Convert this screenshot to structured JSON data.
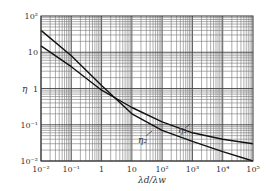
{
  "chart_data": {
    "type": "line",
    "title": "",
    "xlabel": "λ_d/λ_w",
    "ylabel": "η",
    "xscale": "log",
    "yscale": "log",
    "xlim": [
      0.01,
      100000
    ],
    "ylim": [
      0.01,
      100
    ],
    "grid": true,
    "legend": "inline annotations",
    "x_ticks": [
      "10⁻²",
      "10⁻¹",
      "1",
      "10",
      "10²",
      "10³",
      "10⁴",
      "10⁵"
    ],
    "y_ticks": [
      "10⁻²",
      "10⁻¹",
      "1",
      "10",
      "10²"
    ],
    "series": [
      {
        "name": "η₁",
        "x": [
          0.01,
          0.1,
          1,
          10,
          100,
          1000,
          10000,
          100000
        ],
        "y": [
          15,
          4,
          0.9,
          0.3,
          0.12,
          0.06,
          0.04,
          0.03
        ]
      },
      {
        "name": "η₂",
        "x": [
          0.01,
          0.1,
          1,
          10,
          100,
          1000,
          10000,
          100000
        ],
        "y": [
          40,
          8,
          1.2,
          0.2,
          0.07,
          0.035,
          0.018,
          0.01
        ]
      }
    ],
    "annotations": [
      "η₁",
      "η₂"
    ]
  },
  "labels": {
    "xlabel": "λd/λw",
    "ylabel": "η",
    "eta1": "η₁",
    "eta2": "η₂"
  }
}
